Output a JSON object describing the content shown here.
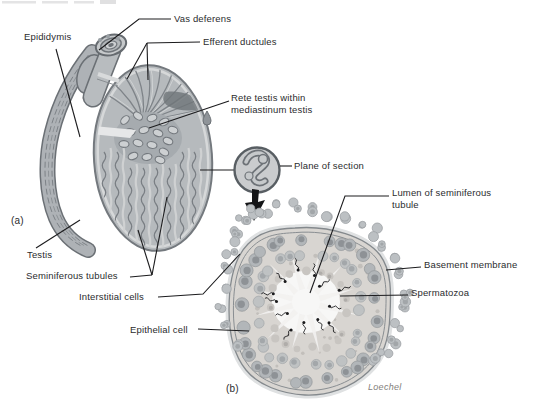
{
  "figure": {
    "panels": {
      "a": "(a)",
      "b": "(b)"
    },
    "signature": "Loechel",
    "labels": {
      "vas_deferens": "Vas deferens",
      "epididymis": "Epididymis",
      "efferent_ductules": "Efferent ductules",
      "rete_testis_line1": "Rete testis within",
      "rete_testis_line2": "mediastinum testis",
      "plane_of_section": "Plane of section",
      "testis": "Testis",
      "seminiferous_tubules": "Seminiferous tubules",
      "interstitial_cells": "Interstitial cells",
      "epithelial_cell": "Epithelial cell",
      "lumen_line1": "Lumen of seminiferous",
      "lumen_line2": "tubule",
      "basement_membrane": "Basement membrane",
      "spermatozoa": "Spermatozoa"
    },
    "colors": {
      "background": "#ffffff",
      "label_text": "#2b2c2e",
      "leader_line": "#1c1c1e",
      "illustration_mid_gray": "#b6babd",
      "illustration_dark_gray": "#6e7478",
      "illustration_light_gray": "#d8dadb",
      "section_fill": "#d8d5d1",
      "lumen_white": "#f7f7f6",
      "spermatozoa_black": "#1b1b1d",
      "signature_gray": "#84817d"
    }
  }
}
